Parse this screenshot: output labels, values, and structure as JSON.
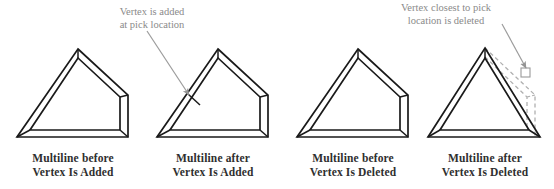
{
  "figure": {
    "background_color": "#ffffff",
    "line_color": "#1a1a1a",
    "ghost_color": "#a8a8a8",
    "caption_color": "#2f2f2f",
    "annotation_color": "#8a8a8a"
  },
  "annotations": [
    {
      "name": "add-annotation",
      "line1": "Vertex is added",
      "line2": "at pick location"
    },
    {
      "name": "delete-annotation",
      "line1": "Vertex closest to pick",
      "line2": "location is deleted"
    }
  ],
  "panels": [
    {
      "id": "multiline-before-vertex-added",
      "line1": "Multiline before",
      "line2": "Vertex Is Added"
    },
    {
      "id": "multiline-after-vertex-added",
      "line1": "Multiline after",
      "line2": "Vertex Is Added"
    },
    {
      "id": "multiline-before-vertex-deleted",
      "line1": "Multiline before",
      "line2": "Vertex Is Deleted"
    },
    {
      "id": "multiline-after-vertex-deleted",
      "line1": "Multiline after",
      "line2": "Vertex Is Deleted"
    }
  ]
}
